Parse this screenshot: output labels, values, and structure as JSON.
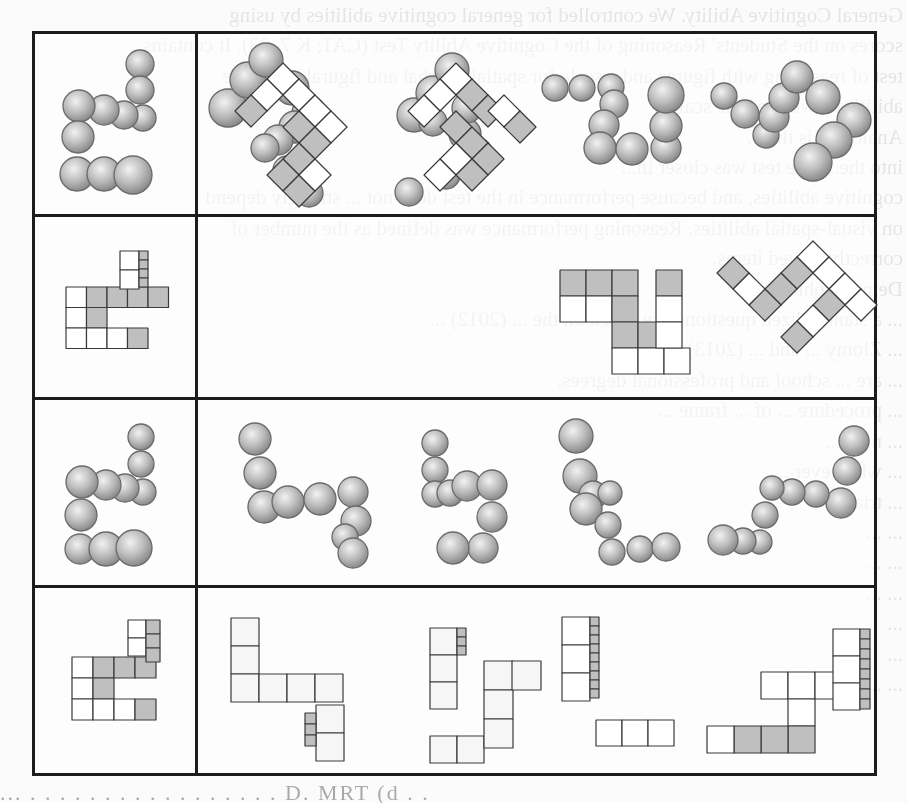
{
  "document": {
    "type": "scanned-figure",
    "figure_title": "Mental rotation test items",
    "grid": {
      "rows": 4,
      "columns": [
        "reference",
        "option-1",
        "option-2",
        "option-3",
        "option-4"
      ]
    },
    "rows": [
      {
        "index": 1,
        "stimulus": "sphere-chain",
        "reference": "sphere-chain-reference",
        "options": [
          "sphere-rotation-a",
          "sphere-rotation-b",
          "sphere-rotation-c",
          "sphere-rotation-d"
        ]
      },
      {
        "index": 2,
        "stimulus": "cube-block",
        "reference": "cube-block-reference",
        "options": [
          "cube-rotation-a",
          "cube-rotation-b",
          "cube-rotation-c",
          "cube-rotation-d"
        ]
      },
      {
        "index": 3,
        "stimulus": "sphere-chain",
        "reference": "sphere-chain-reference",
        "options": [
          "sphere-rotation-a",
          "sphere-rotation-b",
          "sphere-rotation-c",
          "sphere-rotation-d"
        ]
      },
      {
        "index": 4,
        "stimulus": "cube-block",
        "reference": "cube-block-reference",
        "options": [
          "cube-rotation-a",
          "cube-rotation-b",
          "cube-rotation-c",
          "cube-rotation-d"
        ]
      }
    ],
    "colors": {
      "border": "#1c1c1c",
      "sphere": "#bdbdbd",
      "cube_shaded": "#bfbfbf",
      "cube_light": "#ffffff",
      "page": "#fbfbfb"
    }
  },
  "bleed_through_text": [
    "General Cognitive Ability. We controlled for general cognitive abilities by using",
    "scores on the Students' Reasoning of the Cognitive Ability Test (CAT; K 7–23). It contains",
    "test of reasoning with figures and a scale for spatial...verbal and figural cognitive",
    "abilities... we used the scale...",
    "Analogies is the ...",
    "into the...  The test was closer in...",
    "cognitive abilities, and because performance in the test does not ... strongly depend",
    "on visual-spatial abilities. Reasoning performance was defined as the number of",
    "correctly solved items.",
    "",
    "Demographic...",
    "... a standardized questionnaire based on the ... (2012) ...",
    "...  Zlomy ...  and ... (2013) ...",
    "... are ... school and professional degrees.",
    "",
    "... procedure ... of ... frame ...",
    "... next ...",
    "... whichever ...",
    "... trial ...",
    "... ...",
    "...  ...",
    "... ...",
    "...",
    "...",
    "... ..."
  ],
  "footer_fragment": "... . . . . . . . . . . . . . . . . .   D.   MRT   (d . ."
}
